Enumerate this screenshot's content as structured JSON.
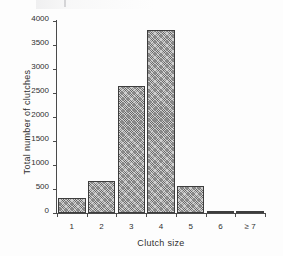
{
  "chart_data": {
    "type": "bar",
    "title": "",
    "xlabel": "Clutch size",
    "ylabel": "Total number of clutches",
    "categories": [
      "1",
      "2",
      "3",
      "4",
      "5",
      "6",
      "≥ 7"
    ],
    "values": [
      320,
      670,
      2650,
      3810,
      560,
      30,
      10
    ],
    "ylim": [
      0,
      4000
    ],
    "yticks": [
      0,
      500,
      1000,
      1500,
      2000,
      2500,
      3000,
      3500,
      4000
    ],
    "ytick_labels": [
      "0",
      "500",
      "1000",
      "1500",
      "2000",
      "2500",
      "3000",
      "3500",
      "4000"
    ],
    "grid": false,
    "legend": null,
    "series": [
      {
        "name": "Total number of clutches",
        "values": [
          320,
          670,
          2650,
          3810,
          560,
          30,
          10
        ]
      }
    ],
    "style": {
      "bar_fill": "#cfcfcf",
      "bar_edge": "#3d3d3d",
      "bar_pattern": "cross-hatch",
      "axis_color": "#4a4a4a",
      "background": "#fdfdfd",
      "tick_direction": "out"
    }
  }
}
